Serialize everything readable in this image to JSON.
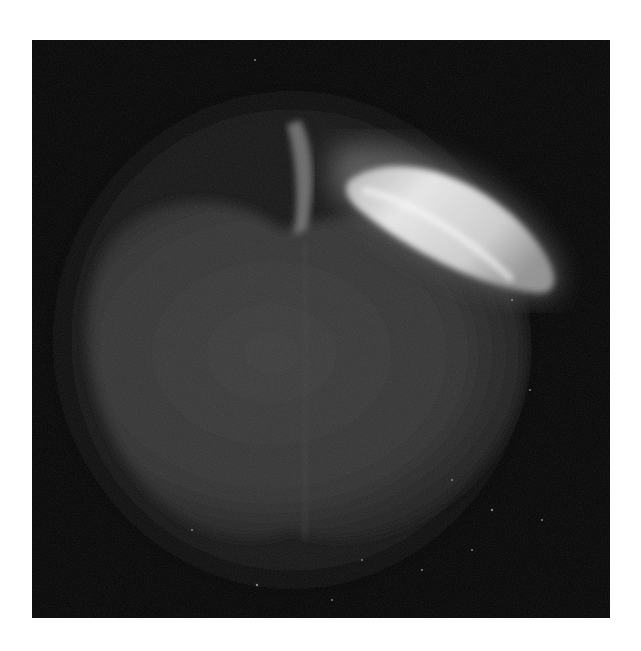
{
  "image": {
    "subject": "apple",
    "description": "Grayscale fluorescence/long-exposure photograph of an apple with a brightly glowing leaf on a black background",
    "colors": {
      "background": "#050505",
      "apple_body": "#3a3a3a",
      "leaf_highlight": "#f2f2f2",
      "frame": "#ffffff"
    }
  }
}
